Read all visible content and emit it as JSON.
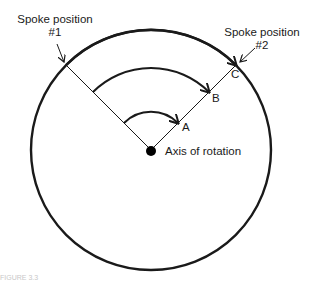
{
  "diagram": {
    "type": "rotation-diagram",
    "labels": {
      "spoke1_line1": "Spoke position",
      "spoke1_line2": "#1",
      "spoke2_line1": "Spoke position",
      "spoke2_line2": "#2",
      "point_a": "A",
      "point_b": "B",
      "point_c": "C",
      "axis": "Axis of rotation"
    },
    "caption": "FIGURE 3.3",
    "colors": {
      "stroke": "#1a1a1a",
      "background": "#ffffff"
    },
    "icons": [
      "axis-dot",
      "arrowhead"
    ]
  }
}
